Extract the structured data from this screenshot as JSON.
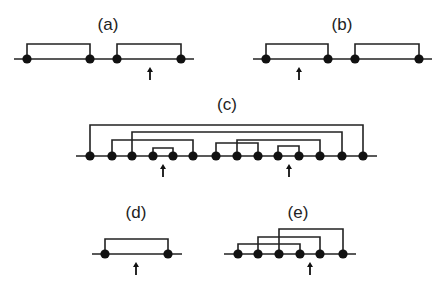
{
  "figure": {
    "panels": [
      {
        "id": "a",
        "label": "(a)",
        "label_pos": [
          108,
          24
        ],
        "baseline": {
          "x1": 14,
          "x2": 194,
          "y": 59
        },
        "dots": [
          27,
          90,
          117,
          181
        ],
        "brackets": [
          {
            "from": 27,
            "to": 90,
            "top": 44
          },
          {
            "from": 117,
            "to": 181,
            "top": 44
          }
        ],
        "arrow_x": 150
      },
      {
        "id": "b",
        "label": "(b)",
        "label_pos": [
          342,
          24
        ],
        "baseline": {
          "x1": 253,
          "x2": 432,
          "y": 59
        },
        "dots": [
          266,
          328,
          355,
          419
        ],
        "brackets": [
          {
            "from": 266,
            "to": 328,
            "top": 44
          },
          {
            "from": 355,
            "to": 419,
            "top": 44
          }
        ],
        "arrow_x": 299
      },
      {
        "id": "c",
        "label": "(c)",
        "label_pos": [
          227,
          104
        ],
        "baseline": {
          "x1": 76,
          "x2": 377,
          "y": 156
        },
        "dots": [
          90,
          112,
          132,
          153,
          173,
          193,
          216,
          237,
          258,
          278,
          299,
          320,
          342,
          363
        ],
        "brackets": [
          {
            "from": 90,
            "to": 363,
            "top": 125
          },
          {
            "from": 132,
            "to": 342,
            "top": 132
          },
          {
            "from": 112,
            "to": 193,
            "top": 140
          },
          {
            "from": 153,
            "to": 173,
            "top": 148
          },
          {
            "from": 237,
            "to": 320,
            "top": 140
          },
          {
            "from": 216,
            "to": 258,
            "top": 143
          },
          {
            "from": 278,
            "to": 299,
            "top": 146
          }
        ],
        "arrow_x": [
          163,
          289
        ]
      },
      {
        "id": "d",
        "label": "(d)",
        "label_pos": [
          136,
          212
        ],
        "baseline": {
          "x1": 92,
          "x2": 182,
          "y": 254
        },
        "dots": [
          105,
          168
        ],
        "brackets": [
          {
            "from": 105,
            "to": 168,
            "top": 239
          }
        ],
        "arrow_x": 136
      },
      {
        "id": "e",
        "label": "(e)",
        "label_pos": [
          298,
          212
        ],
        "baseline": {
          "x1": 224,
          "x2": 356,
          "y": 254
        },
        "dots": [
          238,
          258,
          279,
          300,
          320,
          343
        ],
        "brackets": [
          {
            "from": 279,
            "to": 343,
            "top": 229
          },
          {
            "from": 258,
            "to": 320,
            "top": 237
          },
          {
            "from": 238,
            "to": 300,
            "top": 244
          }
        ],
        "arrow_x": 310
      }
    ],
    "style": {
      "ink": "#111111",
      "background": "#ffffff",
      "dot_radius": 4.6,
      "arrow_length": 11
    }
  }
}
